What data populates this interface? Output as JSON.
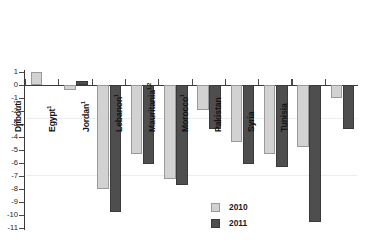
{
  "chart_data": {
    "type": "bar",
    "title": "",
    "subtitle": "",
    "xlabel": "",
    "ylabel": "",
    "ylim": [
      -11,
      1
    ],
    "ytick_labels": [
      "1",
      "0",
      "-1",
      "-2",
      "-3",
      "-4",
      "-5",
      "-6",
      "-7",
      "-8",
      "-9",
      "-10",
      "-11"
    ],
    "yticks": [
      1,
      0,
      -1,
      -2,
      -3,
      -4,
      -5,
      -6,
      -7,
      -8,
      -9,
      -10,
      -11
    ],
    "grid": false,
    "legend_position": "bottom-right",
    "categories": [
      "Afghanistan",
      "Djibouti",
      "Egypt",
      "Jordan",
      "Lebanon",
      "Mauritania",
      "Morocco",
      "Pakistan",
      "Syria",
      "Tunisia"
    ],
    "category_footnotes": [
      "",
      "",
      "1",
      "1",
      "1",
      "1,2",
      "1",
      "",
      "",
      ""
    ],
    "series": [
      {
        "name": "2010",
        "color": "#d2d2d2",
        "values": [
          1.0,
          -0.4,
          -8.0,
          -5.3,
          -7.2,
          -1.9,
          -4.4,
          -5.3,
          -4.8,
          -1.0
        ]
      },
      {
        "name": "2011",
        "color": "#4e4e4e",
        "values": [
          0.0,
          0.3,
          -9.8,
          -6.1,
          -7.7,
          -3.4,
          -6.1,
          -6.3,
          -10.5,
          -3.4
        ]
      }
    ]
  },
  "legend": {
    "items": [
      {
        "label": "2010",
        "color": "#d2d2d2"
      },
      {
        "label": "2011",
        "color": "#4e4e4e"
      }
    ]
  }
}
